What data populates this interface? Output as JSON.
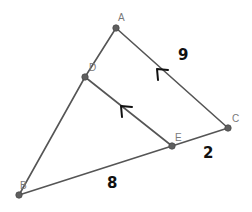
{
  "diagram": {
    "type": "geometry-triangle",
    "points": [
      {
        "id": "A",
        "label": "A",
        "x": 116,
        "y": 28,
        "lx": 119,
        "ly": 20
      },
      {
        "id": "D",
        "label": "D",
        "x": 85,
        "y": 77,
        "lx": 89,
        "ly": 69
      },
      {
        "id": "C",
        "label": "C",
        "x": 228,
        "y": 128,
        "lx": 232,
        "ly": 120
      },
      {
        "id": "E",
        "label": "E",
        "x": 172,
        "y": 146,
        "lx": 175,
        "ly": 139
      },
      {
        "id": "B",
        "label": "B",
        "x": 19,
        "y": 195,
        "lx": 21,
        "ly": 188
      }
    ],
    "segments": [
      {
        "from": "A",
        "to": "D"
      },
      {
        "from": "D",
        "to": "B"
      },
      {
        "from": "A",
        "to": "C"
      },
      {
        "from": "D",
        "to": "E"
      },
      {
        "from": "B",
        "to": "E"
      },
      {
        "from": "E",
        "to": "C"
      }
    ],
    "parallel_marks": [
      {
        "segment": "AC",
        "x": 163,
        "y": 72
      },
      {
        "segment": "DE",
        "x": 127,
        "y": 109
      }
    ],
    "annotations": [
      {
        "id": "len-ac",
        "text": "9",
        "x": 178,
        "y": 60
      },
      {
        "id": "len-ec",
        "text": "2",
        "x": 203,
        "y": 158
      },
      {
        "id": "len-be",
        "text": "8",
        "x": 107,
        "y": 188
      }
    ]
  }
}
